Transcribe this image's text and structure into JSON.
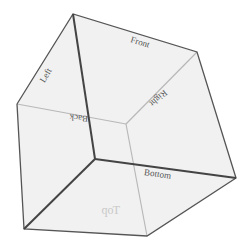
{
  "diagram": {
    "type": "wireframe-cube",
    "faces": [
      {
        "id": "front",
        "label": "Front"
      },
      {
        "id": "left",
        "label": "Left"
      },
      {
        "id": "right",
        "label": "Right"
      },
      {
        "id": "back",
        "label": "Back"
      },
      {
        "id": "top",
        "label": "Top"
      },
      {
        "id": "bottom",
        "label": "Bottom"
      }
    ],
    "colors": {
      "face_fill": "#ececec",
      "edge_dark": "#444444",
      "edge_light": "#b8b8b8",
      "label": "#555555"
    }
  }
}
